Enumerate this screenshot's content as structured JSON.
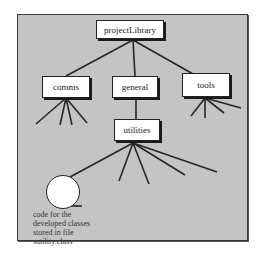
{
  "diagram": {
    "root": {
      "label": "projectLibrary"
    },
    "children": [
      {
        "label": "comms",
        "sub_branches": 4
      },
      {
        "label": "general",
        "sub_branches": 1,
        "child": {
          "label": "utilities",
          "sub_branches": 5
        }
      },
      {
        "label": "tools",
        "sub_branches": 4
      }
    ],
    "leaf_node": {
      "shape": "circle"
    },
    "caption_lines": [
      "code for the",
      "developed classes",
      "stored in file",
      "sutility.class"
    ]
  },
  "colors": {
    "background": "#c4c4c4",
    "box_fill": "#ffffff",
    "line": "#222222"
  }
}
